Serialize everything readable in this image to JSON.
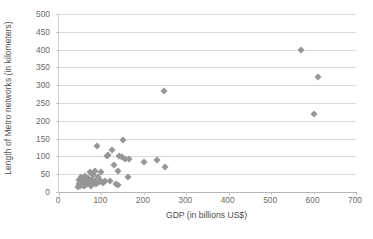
{
  "chart_data": {
    "type": "scatter",
    "title": "",
    "xlabel": "GDP  (in billions US$)",
    "ylabel": "Length of Metro networks (in kilometers)",
    "xlim": [
      0,
      700
    ],
    "ylim": [
      0,
      500
    ],
    "x_ticks": [
      0,
      100,
      200,
      300,
      400,
      500,
      600,
      700
    ],
    "y_ticks": [
      0,
      50,
      100,
      150,
      200,
      250,
      300,
      350,
      400,
      450,
      500
    ],
    "grid": "horizontal",
    "legend": "none",
    "marker_shape": "diamond",
    "marker_color": "#969696",
    "gridline_color": "#d9d9d9",
    "axis_color": "#b5b5b5",
    "series": [
      {
        "name": "Cities",
        "points": [
          [
            44,
            14
          ],
          [
            46,
            22
          ],
          [
            47,
            33
          ],
          [
            49,
            18
          ],
          [
            50,
            27
          ],
          [
            52,
            41
          ],
          [
            54,
            20
          ],
          [
            55,
            30
          ],
          [
            57,
            36
          ],
          [
            58,
            16
          ],
          [
            60,
            25
          ],
          [
            62,
            44
          ],
          [
            64,
            21
          ],
          [
            66,
            31
          ],
          [
            68,
            38
          ],
          [
            70,
            24
          ],
          [
            72,
            55
          ],
          [
            74,
            29
          ],
          [
            76,
            18
          ],
          [
            78,
            35
          ],
          [
            80,
            48
          ],
          [
            82,
            26
          ],
          [
            84,
            60
          ],
          [
            86,
            32
          ],
          [
            88,
            22
          ],
          [
            90,
            130
          ],
          [
            92,
            42
          ],
          [
            95,
            28
          ],
          [
            98,
            57
          ],
          [
            100,
            31
          ],
          [
            104,
            26
          ],
          [
            108,
            30
          ],
          [
            112,
            100
          ],
          [
            116,
            104
          ],
          [
            120,
            32
          ],
          [
            126,
            118
          ],
          [
            130,
            76
          ],
          [
            134,
            22
          ],
          [
            138,
            58
          ],
          [
            140,
            20
          ],
          [
            142,
            102
          ],
          [
            148,
            97
          ],
          [
            152,
            147
          ],
          [
            156,
            94
          ],
          [
            162,
            41
          ],
          [
            166,
            93
          ],
          [
            200,
            85
          ],
          [
            232,
            90
          ],
          [
            248,
            285
          ],
          [
            250,
            69
          ],
          [
            570,
            399
          ],
          [
            600,
            218
          ],
          [
            610,
            324
          ]
        ]
      }
    ]
  }
}
